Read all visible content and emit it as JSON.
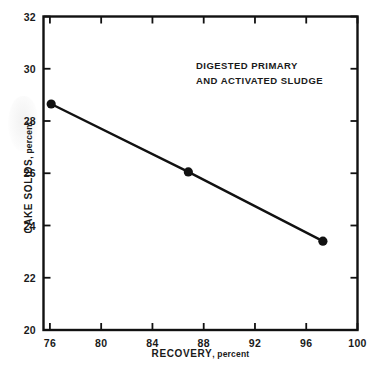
{
  "chart_data": {
    "type": "line",
    "title": "",
    "subtitle": "",
    "annotation_lines": [
      "DIGESTED PRIMARY",
      "AND ACTIVATED SLUDGE"
    ],
    "xlabel": "RECOVERY",
    "xunit": ", percent",
    "ylabel": "CAKE SOLIDS",
    "yunit": ", percent",
    "xlim": [
      75.5,
      100
    ],
    "ylim": [
      20,
      32
    ],
    "xticks": [
      76,
      80,
      84,
      88,
      92,
      96,
      100
    ],
    "yticks": [
      20,
      22,
      24,
      26,
      28,
      30,
      32
    ],
    "xtick_labels": [
      "76",
      "80",
      "84",
      "88",
      "92",
      "96",
      "100"
    ],
    "ytick_labels": [
      "20",
      "22",
      "24",
      "26",
      "28",
      "30",
      "32"
    ],
    "grid": false,
    "legend": "none",
    "series": [
      {
        "name": "Digested primary and activated sludge",
        "marker": "filled-circle",
        "color": "#111111",
        "x": [
          76.1,
          86.8,
          97.3
        ],
        "y": [
          28.65,
          26.05,
          23.4
        ],
        "points": [
          {
            "x": 76.1,
            "y": 28.65
          },
          {
            "x": 86.8,
            "y": 26.05
          },
          {
            "x": 97.3,
            "y": 23.4
          }
        ]
      }
    ]
  },
  "figure": {
    "background_color": "#ffffff",
    "axis_color": "#111111",
    "text_color": "#1a1a1a"
  }
}
